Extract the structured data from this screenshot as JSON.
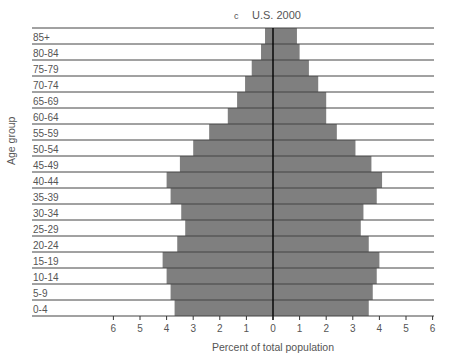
{
  "chart_data": {
    "type": "bar",
    "subtype": "population-pyramid",
    "panel_label": "c",
    "title": "U.S. 2000",
    "xlabel": "Percent of total population",
    "ylabel": "Age group",
    "x_ticks_left": [
      "6",
      "5",
      "4",
      "3",
      "2",
      "1",
      "0"
    ],
    "x_ticks_right": [
      "1",
      "2",
      "3",
      "4",
      "5",
      "6"
    ],
    "xlim": [
      -6,
      6
    ],
    "categories": [
      "85+",
      "80-84",
      "75-79",
      "70-74",
      "65-69",
      "60-64",
      "55-59",
      "50-54",
      "45-49",
      "40-44",
      "35-39",
      "30-34",
      "25-29",
      "20-24",
      "15-19",
      "10-14",
      "5-9",
      "0-4"
    ],
    "series": [
      {
        "name": "Left side",
        "side": "left",
        "values": [
          0.3,
          0.45,
          0.8,
          1.05,
          1.35,
          1.7,
          2.4,
          3.0,
          3.5,
          4.0,
          3.85,
          3.45,
          3.3,
          3.6,
          4.15,
          4.0,
          3.85,
          3.7
        ]
      },
      {
        "name": "Right side",
        "side": "right",
        "values": [
          0.9,
          1.0,
          1.35,
          1.7,
          2.0,
          2.0,
          2.4,
          3.1,
          3.7,
          4.1,
          3.9,
          3.4,
          3.3,
          3.6,
          4.0,
          3.9,
          3.75,
          3.6
        ]
      }
    ],
    "grid": "horizontal row separators",
    "legend": "none",
    "colors": {
      "bar": "#7f7f7f",
      "rule": "#444444",
      "center_line": "#000000",
      "text": "#555555"
    }
  }
}
